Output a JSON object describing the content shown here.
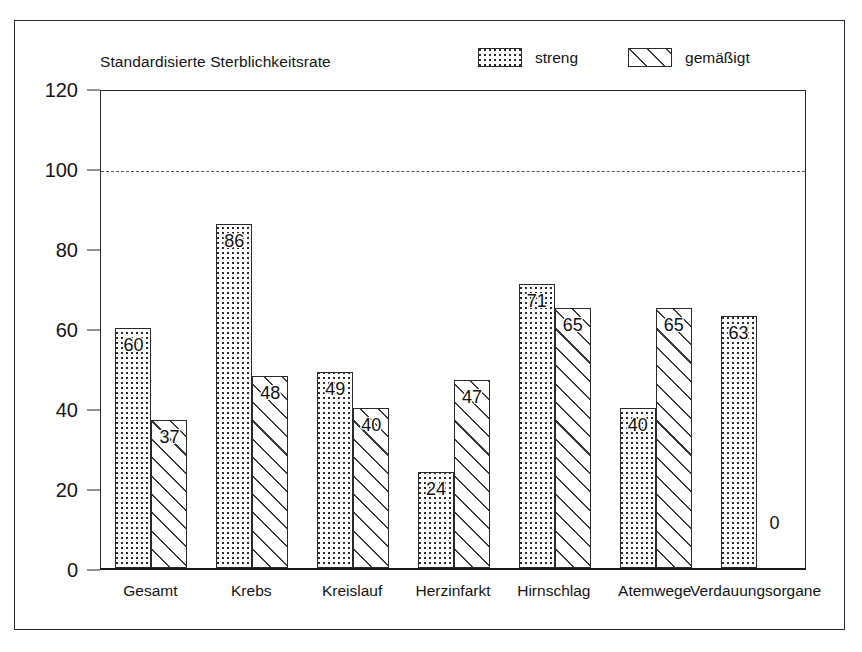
{
  "chart_data": {
    "type": "bar",
    "title": "Standardisierte Sterblichkeitsrate",
    "xlabel": "",
    "ylabel": "",
    "ylim": [
      0,
      120
    ],
    "yticks": [
      0,
      20,
      40,
      60,
      80,
      100,
      120
    ],
    "grid": false,
    "legend_position": "top-right",
    "reference_line": {
      "value": 100,
      "style": "dashed"
    },
    "categories": [
      "Gesamt",
      "Krebs",
      "Kreislauf",
      "Herzinfarkt",
      "Hirnschlag",
      "Atemwege",
      "Verdauungsorgane"
    ],
    "series": [
      {
        "name": "streng",
        "pattern": "dotted",
        "values": [
          60,
          86,
          49,
          24,
          71,
          40,
          63
        ]
      },
      {
        "name": "gemäßigt",
        "pattern": "diagonal-hatch",
        "values": [
          37,
          48,
          40,
          47,
          65,
          65,
          0
        ]
      }
    ]
  },
  "legend": {
    "entries": [
      {
        "label": "streng",
        "pattern": "dotted"
      },
      {
        "label": "gemäßigt",
        "pattern": "diagonal-hatch"
      }
    ]
  },
  "colors": {
    "frame": "#2a2a2a",
    "axis": "#1a1a1a",
    "text": "#141414",
    "pattern": "#2b2b2b",
    "reference_line": "#555555",
    "background": "#ffffff"
  }
}
